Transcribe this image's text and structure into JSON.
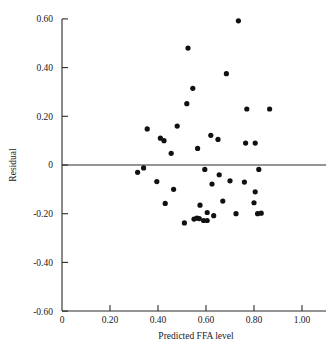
{
  "chart_data": {
    "type": "scatter",
    "title": "",
    "xlabel": "Predicted FFA level",
    "ylabel": "Residual",
    "xlim": [
      0,
      1.1
    ],
    "ylim": [
      -0.6,
      0.6
    ],
    "grid": false,
    "legend": "none",
    "reference_line": {
      "orientation": "horizontal",
      "y": 0
    },
    "xticks": [
      0,
      0.2,
      0.4,
      0.6,
      0.8,
      1.0
    ],
    "xticklabels": [
      "0",
      "0.20",
      "0.40",
      "0.60",
      "0.80",
      "1.00"
    ],
    "yticks": [
      0.6,
      0.4,
      0.2,
      0,
      -0.2,
      -0.4,
      -0.6
    ],
    "yticklabels": [
      "0.60",
      "0.40",
      "0.20",
      "0",
      "-0.20",
      "-0.40",
      "-0.60"
    ],
    "x": [
      0.735,
      0.525,
      0.685,
      0.545,
      0.52,
      0.77,
      0.865,
      0.355,
      0.48,
      0.62,
      0.41,
      0.425,
      0.65,
      0.805,
      0.565,
      0.455,
      0.765,
      0.315,
      0.34,
      0.595,
      0.655,
      0.82,
      0.395,
      0.7,
      0.76,
      0.465,
      0.805,
      0.625,
      0.575,
      0.67,
      0.8,
      0.43,
      0.815,
      0.605,
      0.632,
      0.725,
      0.83,
      0.51,
      0.55,
      0.562,
      0.572,
      0.59,
      0.605
    ],
    "y": [
      0.592,
      0.48,
      0.375,
      0.315,
      0.252,
      0.23,
      0.23,
      0.148,
      0.16,
      0.122,
      0.11,
      0.1,
      0.105,
      0.09,
      0.068,
      0.048,
      0.09,
      -0.03,
      -0.012,
      -0.018,
      -0.04,
      -0.018,
      -0.068,
      -0.065,
      -0.07,
      -0.1,
      -0.11,
      -0.078,
      -0.165,
      -0.148,
      -0.155,
      -0.158,
      -0.2,
      -0.195,
      -0.208,
      -0.2,
      -0.198,
      -0.238,
      -0.222,
      -0.218,
      -0.22,
      -0.228,
      -0.228
    ],
    "point_count": 43,
    "marker": {
      "shape": "circle",
      "size_px": 2.6,
      "color": "#111111"
    }
  },
  "axes": {
    "x_title": "Predicted FFA level",
    "y_title": "Residual"
  }
}
